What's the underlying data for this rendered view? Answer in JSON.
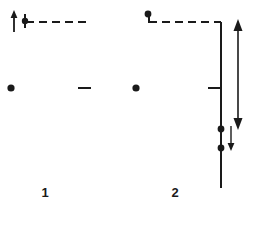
{
  "figure": {
    "type": "line-diagram",
    "background_color": "#ffffff",
    "stroke_color": "#1a1a1a",
    "panels": [
      {
        "id": "panel-1",
        "label": "1",
        "label_x": 45,
        "label_y": 197,
        "free_dot": {
          "cx": 11,
          "cy": 88,
          "r": 3.6
        },
        "top_dot": {
          "cx": 25,
          "cy": 21,
          "r": 3.2
        },
        "up_arrow": {
          "x": 14,
          "y_tail": 32,
          "y_head": 12,
          "head_width": 5,
          "head_height": 6
        },
        "dashed_line": {
          "x1": 26,
          "x2": 91,
          "y": 22,
          "dash": "8 5",
          "width": 2.0
        },
        "vertical_line": {
          "x": 91,
          "y1": 22,
          "y2": 188,
          "width": 2.0,
          "fade": true
        },
        "tick": {
          "x1": 78,
          "x2": 91,
          "y": 88,
          "width": 2.0
        },
        "dots_on_line": [],
        "long_arrow": null,
        "short_arrow": null
      },
      {
        "id": "panel-2",
        "label": "2",
        "label_x": 175,
        "label_y": 197,
        "free_dot": {
          "cx": 136,
          "cy": 88,
          "r": 3.6
        },
        "top_dot": {
          "cx": 148,
          "cy": 14,
          "r": 3.4
        },
        "top_stub": {
          "x": 149,
          "y1": 14,
          "y2": 22,
          "width": 2.0
        },
        "up_arrow": null,
        "dashed_line": {
          "x1": 149,
          "x2": 221,
          "y": 22,
          "dash": "8 5",
          "width": 2.0
        },
        "vertical_line": {
          "x": 221,
          "y1": 22,
          "y2": 188,
          "width": 2.0,
          "fade": false
        },
        "tick": {
          "x1": 208,
          "x2": 221,
          "y": 88,
          "width": 2.0
        },
        "dots_on_line": [
          {
            "cx": 221,
            "cy": 129,
            "r": 3.4
          },
          {
            "cx": 221,
            "cy": 148,
            "r": 3.4
          }
        ],
        "long_arrow": {
          "x": 238,
          "y_top": 20,
          "y_bottom": 128,
          "head_width": 6,
          "head_height": 10,
          "double_headed": true,
          "width": 1.6
        },
        "short_arrow": {
          "x": 231,
          "y_tail": 126,
          "y_head": 150,
          "head_width": 3.5,
          "head_height": 6,
          "double_headed": false,
          "width": 1.4
        }
      }
    ]
  }
}
